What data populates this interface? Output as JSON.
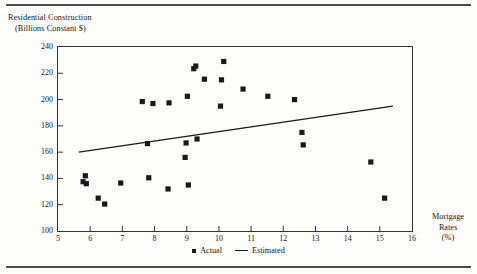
{
  "chart_data": {
    "type": "scatter",
    "title": "",
    "ylabel_line1": "Residential Construction",
    "ylabel_line2": "(Billions Constant $)",
    "xlabel_line1": "Mortgage",
    "xlabel_line2": "Rates",
    "xlabel_line3": "(%)",
    "xlim": [
      5,
      16
    ],
    "ylim": [
      100,
      240
    ],
    "xticks": [
      5,
      6,
      7,
      8,
      9,
      10,
      11,
      12,
      13,
      14,
      15,
      16
    ],
    "yticks": [
      100,
      120,
      140,
      160,
      180,
      200,
      220,
      240
    ],
    "grid": false,
    "legend_position": "bottom-center",
    "marker_color": "#1a1a1a",
    "line_color": "#1a1a1a",
    "series": [
      {
        "name": "Actual",
        "type": "scatter",
        "points": [
          [
            5.78,
            137.5
          ],
          [
            5.85,
            142.0
          ],
          [
            5.88,
            136.0
          ],
          [
            6.25,
            125.0
          ],
          [
            6.45,
            120.5
          ],
          [
            6.95,
            136.5
          ],
          [
            7.62,
            198.5
          ],
          [
            7.78,
            166.5
          ],
          [
            7.82,
            140.5
          ],
          [
            7.95,
            197.0
          ],
          [
            8.42,
            132.0
          ],
          [
            8.45,
            197.5
          ],
          [
            8.95,
            156.0
          ],
          [
            8.98,
            167.0
          ],
          [
            9.02,
            202.5
          ],
          [
            9.05,
            135.0
          ],
          [
            9.22,
            223.5
          ],
          [
            9.28,
            225.5
          ],
          [
            9.32,
            170.0
          ],
          [
            9.55,
            215.5
          ],
          [
            10.05,
            195.0
          ],
          [
            10.08,
            215.0
          ],
          [
            10.15,
            229.0
          ],
          [
            10.75,
            208.0
          ],
          [
            11.52,
            202.5
          ],
          [
            12.35,
            200.0
          ],
          [
            12.58,
            175.0
          ],
          [
            12.62,
            165.5
          ],
          [
            14.72,
            152.5
          ],
          [
            15.15,
            125.0
          ]
        ]
      },
      {
        "name": "Estimated",
        "type": "line",
        "points": [
          [
            5.65,
            160.0
          ],
          [
            15.4,
            195.0
          ]
        ]
      }
    ],
    "legend": [
      {
        "label": "Actual",
        "marker": "square"
      },
      {
        "label": "Estimated",
        "marker": "line"
      }
    ]
  }
}
